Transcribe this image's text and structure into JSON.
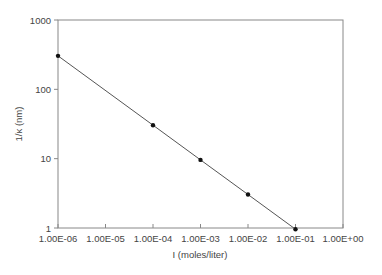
{
  "chart_data": {
    "type": "line",
    "title": "",
    "xlabel": "I (moles/liter)",
    "ylabel": "1/κ (nm)",
    "xscale": "log",
    "yscale": "log",
    "xlim": [
      1e-06,
      1
    ],
    "ylim": [
      1,
      1000
    ],
    "x_tick_labels": [
      "1.00E-06",
      "1.00E-05",
      "1.00E-04",
      "1.00E-03",
      "1.00E-02",
      "1.00E-01",
      "1.00E+00"
    ],
    "y_tick_labels": [
      "1",
      "10",
      "100",
      "1000"
    ],
    "grid": false,
    "legend": null,
    "series": [
      {
        "name": "Debye length",
        "x": [
          1e-06,
          0.0001,
          0.001,
          0.01,
          0.1
        ],
        "y": [
          304,
          30.4,
          9.6,
          3.04,
          0.96
        ],
        "marker": "circle",
        "color": "#333333"
      }
    ]
  }
}
